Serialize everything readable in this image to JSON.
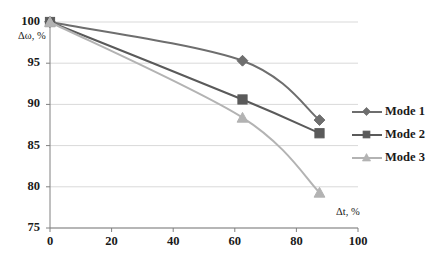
{
  "chart_data": {
    "type": "line",
    "title": "",
    "xlabel": "Δt, %",
    "ylabel": "Δω, %",
    "xlim": [
      0,
      100
    ],
    "ylim": [
      75,
      100
    ],
    "x_ticks": [
      0,
      20,
      40,
      60,
      80,
      100
    ],
    "y_ticks": [
      75,
      80,
      85,
      90,
      95,
      100
    ],
    "x_tick_labels": [
      "0",
      "20",
      "40",
      "60",
      "80",
      "100"
    ],
    "y_tick_labels": [
      "75",
      "80",
      "85",
      "90",
      "95",
      "100"
    ],
    "grid": "horizontal",
    "legend_position": "right",
    "x": [
      0,
      62.5,
      87.5
    ],
    "series": [
      {
        "name": "Mode 1",
        "values": [
          100,
          95.3,
          88.1
        ],
        "marker": "diamond",
        "color": "#6e6e6e"
      },
      {
        "name": "Mode 2",
        "values": [
          100,
          90.6,
          86.5
        ],
        "marker": "square",
        "color": "#5a5a5a"
      },
      {
        "name": "Mode 3",
        "values": [
          100,
          88.4,
          79.3
        ],
        "marker": "triangle",
        "color": "#b3b3b3"
      }
    ]
  },
  "axes": {
    "y_label": "Δω, %",
    "x_label": "Δt, %",
    "y_ticks": [
      "100",
      "95",
      "90",
      "85",
      "80",
      "75"
    ],
    "x_ticks": [
      "0",
      "20",
      "40",
      "60",
      "80",
      "100"
    ]
  },
  "legend": {
    "items": [
      {
        "label": "Mode 1"
      },
      {
        "label": "Mode 2"
      },
      {
        "label": "Mode 3"
      }
    ]
  },
  "colors": {
    "series_1": "#6e6e6e",
    "series_2": "#5a5a5a",
    "series_3": "#b3b3b3",
    "grid": "#d9d9d9",
    "axis": "#808080",
    "text": "#1a1a1a",
    "background": "#ffffff"
  }
}
